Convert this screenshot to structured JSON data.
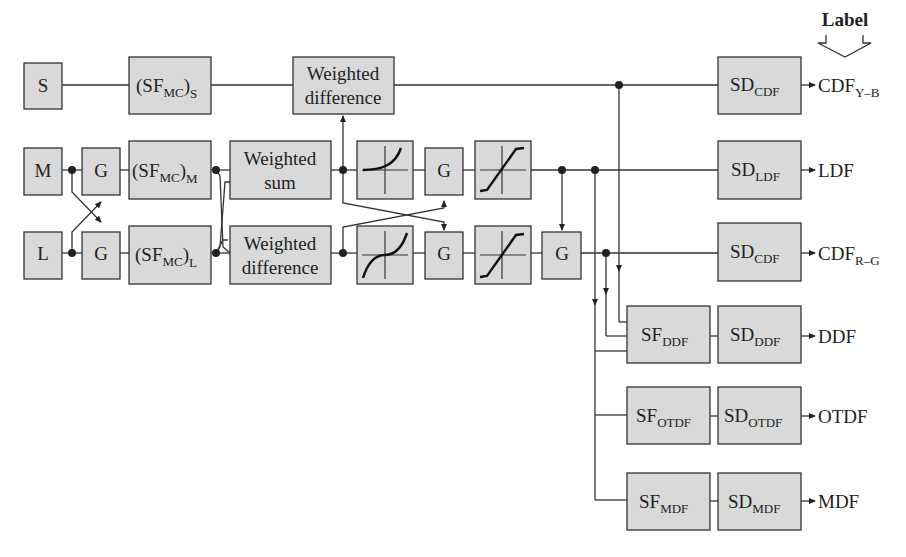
{
  "header": {
    "label": "Label"
  },
  "inputs": {
    "s": "S",
    "m": "M",
    "l": "L"
  },
  "blocks": {
    "gain": "G",
    "sfmc": {
      "base": "(SF",
      "sub": "MC",
      "close": ")",
      "s": "S",
      "m": "M",
      "l": "L"
    },
    "weighted_difference": [
      "Weighted",
      "difference"
    ],
    "weighted_sum": [
      "Weighted",
      "sum"
    ]
  },
  "outputs": [
    {
      "sd_sub": "CDF",
      "label": "CDF",
      "label_sub": "Y–B"
    },
    {
      "sd_sub": "LDF",
      "label": "LDF",
      "label_sub": ""
    },
    {
      "sd_sub": "CDF",
      "label": "CDF",
      "label_sub": "R–G"
    },
    {
      "sf_sub": "DDF",
      "sd_sub": "DDF",
      "label": "DDF"
    },
    {
      "sf_sub": "OTDF",
      "sd_sub": "OTDF",
      "label": "OTDF"
    },
    {
      "sf_sub": "MDF",
      "sd_sub": "MDF",
      "label": "MDF"
    }
  ],
  "prefix": {
    "sd": "SD",
    "sf": "SF"
  }
}
